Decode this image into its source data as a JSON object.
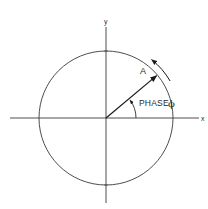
{
  "axes": {
    "x_label": "x",
    "y_label": "y"
  },
  "vector": {
    "label": "A",
    "angle_deg": 40
  },
  "phase": {
    "label": "PHASE",
    "symbol": "ϕ"
  },
  "rotation": {
    "direction": "counterclockwise"
  },
  "colors": {
    "ink": "#2a2a2a",
    "background": "#ffffff"
  }
}
